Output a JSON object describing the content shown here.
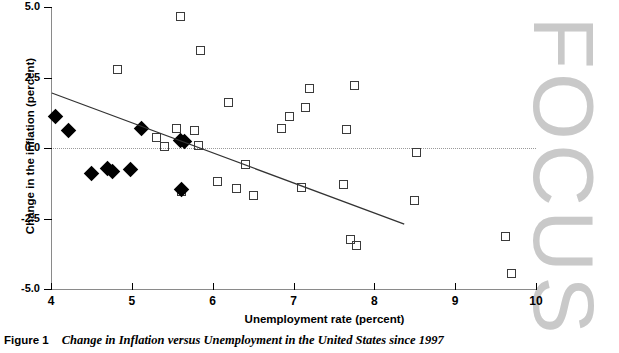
{
  "figure": {
    "label": "Figure 1",
    "title": "Change in Inflation versus Unemployment in the United States since 1997"
  },
  "watermark": {
    "text": "FOCUS"
  },
  "chart_data": {
    "type": "scatter",
    "title": "Change in Inflation versus Unemployment in the United States since 1997",
    "xlabel": "Unemployment rate (percent)",
    "ylabel": "Change in the inflation (percent)",
    "xlim": [
      4,
      10
    ],
    "ylim": [
      -5.0,
      5.0
    ],
    "xticks": [
      4,
      5,
      6,
      7,
      8,
      9,
      10
    ],
    "xtick_labels": [
      "4",
      "5",
      "6",
      "7",
      "8",
      "9",
      "10"
    ],
    "yticks": [
      5.0,
      2.5,
      0.0,
      -2.5,
      -5.0
    ],
    "ytick_labels": [
      "5.0",
      "2.5",
      "0.0",
      "-2.5",
      "-5.0"
    ],
    "grid": false,
    "zero_reference_line": 0.0,
    "legend": [],
    "series": [
      {
        "name": "open-squares",
        "marker": "open-square",
        "color": "#3b3b3b",
        "points": [
          [
            5.6,
            4.65
          ],
          [
            5.85,
            3.45
          ],
          [
            4.82,
            2.8
          ],
          [
            7.75,
            2.2
          ],
          [
            7.15,
            1.45
          ],
          [
            6.95,
            1.1
          ],
          [
            6.2,
            1.6
          ],
          [
            7.2,
            2.1
          ],
          [
            5.3,
            0.38
          ],
          [
            5.55,
            0.7
          ],
          [
            5.78,
            0.62
          ],
          [
            7.65,
            0.65
          ],
          [
            6.85,
            0.7
          ],
          [
            5.4,
            0.05
          ],
          [
            5.82,
            0.08
          ],
          [
            8.52,
            -0.17
          ],
          [
            6.4,
            -0.6
          ],
          [
            5.62,
            -1.55
          ],
          [
            6.3,
            -1.45
          ],
          [
            6.5,
            -1.7
          ],
          [
            7.1,
            -1.4
          ],
          [
            7.62,
            -1.3
          ],
          [
            8.5,
            -1.85
          ],
          [
            7.7,
            -3.25
          ],
          [
            7.78,
            -3.45
          ],
          [
            9.62,
            -3.15
          ],
          [
            9.7,
            -4.45
          ],
          [
            6.06,
            -1.2
          ]
        ]
      },
      {
        "name": "filled-diamonds",
        "marker": "filled-diamond",
        "color": "#000000",
        "points": [
          [
            4.05,
            1.1
          ],
          [
            4.22,
            0.62
          ],
          [
            5.12,
            0.68
          ],
          [
            5.6,
            0.28
          ],
          [
            5.65,
            0.22
          ],
          [
            4.5,
            -0.9
          ],
          [
            4.7,
            -0.72
          ],
          [
            4.76,
            -0.82
          ],
          [
            4.98,
            -0.78
          ],
          [
            5.62,
            -1.48
          ]
        ]
      }
    ],
    "trend_line": {
      "name": "fitted-regression-line",
      "x_start": 4.01,
      "y_start": 1.95,
      "x_end": 8.37,
      "y_end": -2.7,
      "color": "#333333"
    }
  }
}
